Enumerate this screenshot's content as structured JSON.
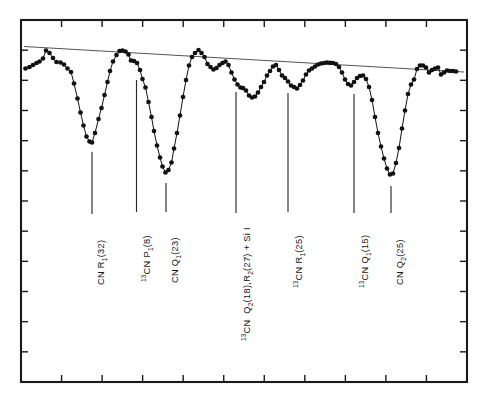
{
  "figure": {
    "name": "stellar-spectrum-cn-lines",
    "background_color": "#ffffff",
    "frame_color": "#1a1a1a",
    "data_color": "#111111",
    "continuum_color": "#555555",
    "marker_radius": 2.35,
    "frame": {
      "x0": 21,
      "y0": 20,
      "x1": 467,
      "y1": 382
    }
  },
  "chart_data": {
    "type": "line",
    "title": "",
    "subtitle": "",
    "xlabel": "",
    "ylabel": "",
    "grid": false,
    "legend_position": "none",
    "xlim": [
      0,
      487
    ],
    "ylim": [
      382,
      20
    ],
    "axes": {
      "top_ticks": 10,
      "bottom_ticks": 10,
      "left_ticks": 11,
      "right_ticks": 11,
      "tick_labels": [],
      "tick_direction": "inward",
      "tick_length": 7
    },
    "continuum": {
      "name": "continuum-fit",
      "x": [
        24,
        464
      ],
      "y": [
        46.5,
        72.0
      ]
    },
    "series": [
      {
        "name": "observed-spectrum",
        "marker": "filled-circle",
        "points": [
          [
            25.5,
            68.5
          ],
          [
            29.5,
            67.0
          ],
          [
            33.0,
            65.0
          ],
          [
            36.5,
            63.0
          ],
          [
            39.5,
            61.5
          ],
          [
            43.0,
            58.5
          ],
          [
            46.0,
            50.5
          ],
          [
            49.5,
            53.0
          ],
          [
            53.0,
            58.0
          ],
          [
            56.5,
            62.0
          ],
          [
            60.5,
            62.5
          ],
          [
            64.0,
            64.5
          ],
          [
            67.5,
            68.5
          ],
          [
            71.0,
            72.0
          ],
          [
            74.0,
            83.5
          ],
          [
            77.5,
            98.5
          ],
          [
            80.5,
            112.5
          ],
          [
            83.5,
            125.5
          ],
          [
            86.5,
            136.5
          ],
          [
            89.5,
            141.5
          ],
          [
            92.0,
            142.5
          ],
          [
            95.0,
            133.0
          ],
          [
            98.5,
            119.0
          ],
          [
            101.5,
            108.0
          ],
          [
            104.5,
            95.0
          ],
          [
            107.5,
            82.0
          ],
          [
            110.0,
            71.0
          ],
          [
            113.0,
            61.5
          ],
          [
            116.5,
            55.0
          ],
          [
            119.5,
            51.0
          ],
          [
            122.5,
            50.5
          ],
          [
            125.5,
            51.5
          ],
          [
            128.5,
            54.5
          ],
          [
            131.0,
            60.5
          ],
          [
            134.0,
            61.0
          ],
          [
            137.0,
            63.0
          ],
          [
            140.0,
            70.0
          ],
          [
            142.5,
            79.0
          ],
          [
            145.5,
            87.5
          ],
          [
            148.5,
            102.0
          ],
          [
            151.5,
            117.0
          ],
          [
            154.0,
            131.0
          ],
          [
            157.0,
            145.5
          ],
          [
            160.0,
            157.5
          ],
          [
            162.5,
            166.5
          ],
          [
            165.5,
            172.5
          ],
          [
            168.5,
            170.0
          ],
          [
            171.5,
            162.5
          ],
          [
            174.0,
            148.5
          ],
          [
            177.0,
            133.0
          ],
          [
            180.0,
            115.5
          ],
          [
            183.0,
            97.0
          ],
          [
            186.0,
            80.0
          ],
          [
            189.0,
            65.5
          ],
          [
            192.0,
            57.0
          ],
          [
            195.0,
            53.0
          ],
          [
            198.5,
            50.0
          ],
          [
            201.5,
            53.0
          ],
          [
            204.5,
            57.0
          ],
          [
            207.5,
            64.0
          ],
          [
            210.5,
            67.0
          ],
          [
            213.5,
            69.5
          ],
          [
            216.5,
            68.0
          ],
          [
            219.5,
            65.0
          ],
          [
            222.5,
            63.0
          ],
          [
            225.5,
            61.5
          ],
          [
            228.5,
            65.0
          ],
          [
            231.5,
            72.5
          ],
          [
            234.5,
            79.5
          ],
          [
            237.5,
            84.5
          ],
          [
            240.5,
            87.5
          ],
          [
            243.0,
            88.0
          ],
          [
            246.0,
            90.5
          ],
          [
            249.0,
            95.5
          ],
          [
            252.0,
            97.5
          ],
          [
            255.0,
            96.5
          ],
          [
            258.0,
            92.5
          ],
          [
            261.0,
            87.0
          ],
          [
            264.0,
            82.0
          ],
          [
            267.0,
            75.5
          ],
          [
            270.0,
            71.0
          ],
          [
            273.0,
            66.5
          ],
          [
            276.0,
            65.0
          ],
          [
            279.0,
            70.0
          ],
          [
            282.0,
            75.5
          ],
          [
            285.0,
            78.0
          ],
          [
            288.0,
            81.5
          ],
          [
            291.0,
            85.5
          ],
          [
            294.0,
            87.0
          ],
          [
            297.0,
            88.5
          ],
          [
            300.0,
            85.0
          ],
          [
            303.0,
            80.5
          ],
          [
            306.0,
            74.5
          ],
          [
            309.0,
            70.5
          ],
          [
            312.0,
            68.5
          ],
          [
            315.0,
            66.5
          ],
          [
            318.0,
            64.5
          ],
          [
            321.0,
            63.5
          ],
          [
            324.0,
            63.0
          ],
          [
            327.0,
            62.5
          ],
          [
            330.0,
            62.8
          ],
          [
            333.0,
            63.0
          ],
          [
            336.0,
            64.0
          ],
          [
            339.0,
            67.0
          ],
          [
            342.0,
            72.5
          ],
          [
            345.0,
            79.5
          ],
          [
            348.0,
            84.0
          ],
          [
            351.0,
            85.5
          ],
          [
            354.0,
            82.0
          ],
          [
            357.0,
            78.0
          ],
          [
            360.0,
            76.0
          ],
          [
            363.0,
            75.5
          ],
          [
            366.0,
            79.0
          ],
          [
            369.0,
            87.0
          ],
          [
            372.0,
            100.0
          ],
          [
            375.0,
            117.0
          ],
          [
            378.0,
            133.0
          ],
          [
            381.0,
            146.5
          ],
          [
            384.0,
            158.5
          ],
          [
            387.0,
            168.5
          ],
          [
            390.0,
            174.5
          ],
          [
            393.0,
            173.5
          ],
          [
            396.0,
            163.0
          ],
          [
            399.0,
            148.0
          ],
          [
            402.0,
            128.5
          ],
          [
            405.0,
            110.5
          ],
          [
            408.0,
            94.0
          ],
          [
            411.0,
            84.5
          ],
          [
            414.0,
            79.5
          ],
          [
            417.0,
            69.0
          ],
          [
            420.0,
            65.5
          ],
          [
            423.0,
            65.5
          ],
          [
            426.0,
            67.5
          ],
          [
            429.0,
            72.5
          ],
          [
            432.0,
            70.0
          ],
          [
            435.0,
            68.5
          ],
          [
            438.0,
            67.5
          ],
          [
            441.0,
            74.5
          ],
          [
            444.0,
            72.5
          ],
          [
            447.0,
            70.5
          ],
          [
            450.0,
            71.0
          ],
          [
            453.0,
            71.0
          ],
          [
            456.0,
            71.5
          ]
        ]
      }
    ],
    "annotations": [
      {
        "id": "cn-r1-32",
        "text": "CN R₁(32)",
        "html": "CN R<sub>1</sub>(32)",
        "pointer_x": 92.0,
        "pointer_y_top": 152.0,
        "pointer_y_bottom": 214.0,
        "label_x": 92.0,
        "label_y": 285.0
      },
      {
        "id": "13cn-p1-8",
        "text": "¹³CN P₁(8)",
        "html": "<sup>13</sup>CN P<sub>1</sub>(8)",
        "pointer_x": 136.5,
        "pointer_y_top": 80.0,
        "pointer_y_bottom": 212.0,
        "label_x": 136.5,
        "label_y": 282.0
      },
      {
        "id": "cn-q1-23",
        "text": "CN Q₁(23)",
        "html": "CN Q<sub>1</sub>(23)",
        "pointer_x": 166.0,
        "pointer_y_top": 183.0,
        "pointer_y_bottom": 212.0,
        "label_x": 166.0,
        "label_y": 283.0
      },
      {
        "id": "13cn-q2-18-r2-27-si1",
        "text": "¹³CN  Q₂(18), R₂(27) + Si I",
        "html": "<sup>13</sup>CN&nbsp; Q<sub>2</sub>(18),R<sub>2</sub>(27) + Si I",
        "pointer_x": 236.0,
        "pointer_y_top": 92.0,
        "pointer_y_bottom": 213.0,
        "label_x": 236.0,
        "label_y": 341.0
      },
      {
        "id": "13cn-r1-25",
        "text": "¹³CN R₁(25)",
        "html": "<sup>13</sup>CN R<sub>1</sub>(25)",
        "pointer_x": 288.0,
        "pointer_y_top": 93.0,
        "pointer_y_bottom": 212.0,
        "label_x": 288.0,
        "label_y": 288.0
      },
      {
        "id": "13cn-q1-15",
        "text": "¹³CN Q₁(15)",
        "html": "<sup>13</sup>CN Q<sub>1</sub>(15)",
        "pointer_x": 354.0,
        "pointer_y_top": 94.0,
        "pointer_y_bottom": 213.0,
        "label_x": 354.0,
        "label_y": 288.0
      },
      {
        "id": "cn-q2-25",
        "text": "CN Q₂(25)",
        "html": "CN Q<sub>2</sub>(25)",
        "pointer_x": 391.0,
        "pointer_y_top": 186.0,
        "pointer_y_bottom": 213.0,
        "label_x": 391.0,
        "label_y": 285.0
      }
    ]
  }
}
